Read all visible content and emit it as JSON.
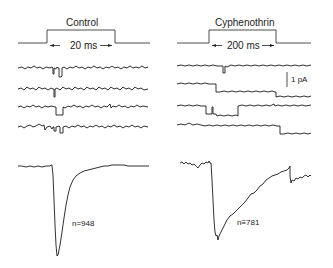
{
  "panels": {
    "control": {
      "title": "Control",
      "pulse_label": "20 ms",
      "average_label": "n=948",
      "traces_count": 4
    },
    "cyphenothrin": {
      "title": "Cyphenothrin",
      "pulse_label": "200 ms",
      "average_label": "n≡781",
      "scale_bar_label": "1 pA",
      "traces_count": 4
    }
  },
  "colors": {
    "trace": "#1a1a1a",
    "background": "#ffffff"
  }
}
